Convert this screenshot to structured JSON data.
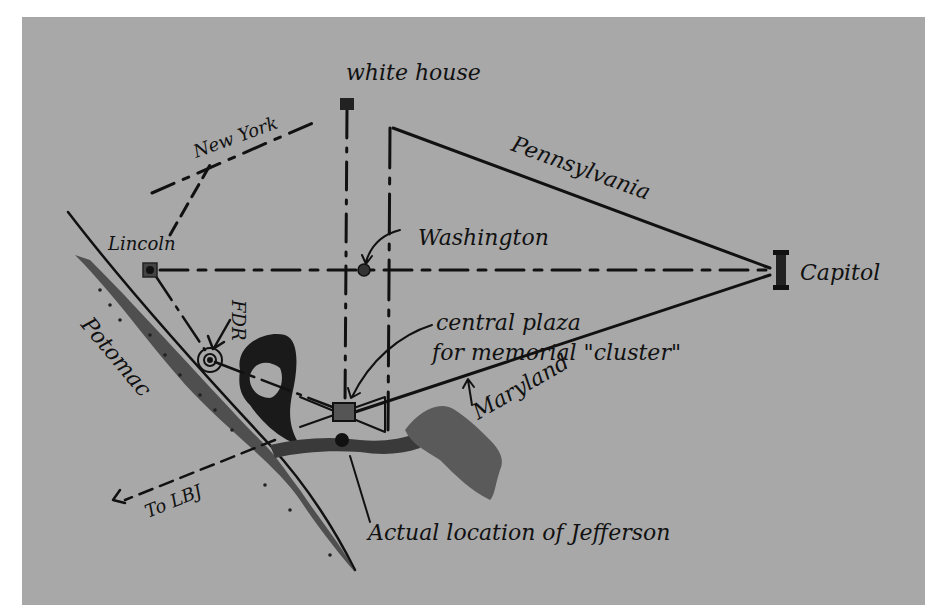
{
  "map": {
    "type": "hand-drawn sketch map",
    "colors": {
      "paper": "#a8a8a8",
      "ink": "#111111",
      "water": "#3c3c3c",
      "margin": "#ffffff"
    },
    "landmarks": [
      {
        "id": "white-house",
        "label": "white house",
        "x": 347,
        "y": 104
      },
      {
        "id": "washington",
        "label": "Washington",
        "x": 364,
        "y": 270
      },
      {
        "id": "lincoln",
        "label": "Lincoln",
        "x": 150,
        "y": 270
      },
      {
        "id": "capitol",
        "label": "Capitol",
        "x": 780,
        "y": 270
      },
      {
        "id": "fdr",
        "label": "FDR",
        "x": 210,
        "y": 360
      },
      {
        "id": "central-plaza",
        "label": "central plaza\nfor memorial \"cluster\"",
        "x": 343,
        "y": 411
      },
      {
        "id": "jefferson",
        "label": "Actual location of Jefferson",
        "x": 342,
        "y": 440
      }
    ],
    "roads": [
      {
        "id": "new-york",
        "label": "New York"
      },
      {
        "id": "pennsylvania",
        "label": "Pennsylvania"
      },
      {
        "id": "maryland",
        "label": "Maryland"
      }
    ],
    "water": {
      "label": "Potomac"
    },
    "directions": {
      "to_lbj": "To LBJ"
    },
    "labels": {
      "white_house": "white house",
      "new_york": "New York",
      "pennsylvania": "Pennsylvania",
      "lincoln": "Lincoln",
      "washington": "Washington",
      "capitol": "Capitol",
      "fdr": "FDR",
      "central_plaza_line1": "central plaza",
      "central_plaza_line2": "for memorial \"cluster\"",
      "maryland": "Maryland",
      "potomac": "Potomac",
      "to_lbj": "To LBJ",
      "jefferson": "Actual location of Jefferson"
    }
  }
}
